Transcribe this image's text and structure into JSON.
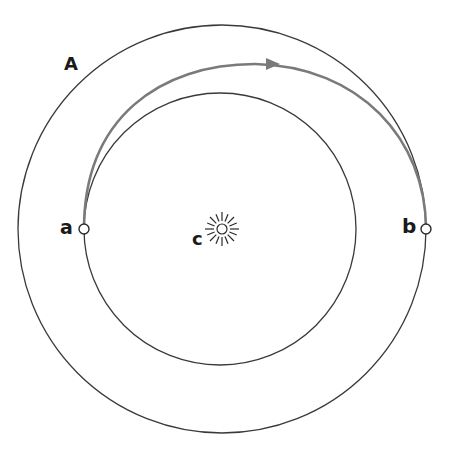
{
  "diagram": {
    "type": "orbit-transfer",
    "labels": {
      "outer_orbit": "A",
      "point_start": "a",
      "point_end": "b",
      "center": "c"
    },
    "colors": {
      "orbit_line": "#3a3a3a",
      "transfer_path": "#7a7a7a",
      "label": "#1a1a1a",
      "background": "#ffffff"
    }
  }
}
